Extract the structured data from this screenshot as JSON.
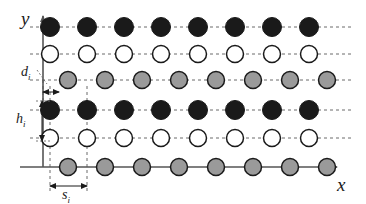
{
  "figure": {
    "axes": {
      "x_label": "x",
      "y_label": "y",
      "axis_color": "#555555",
      "origin": {
        "x": 43,
        "y": 167
      }
    },
    "colors": {
      "filled_black": "#1a1a1a",
      "filled_white": "#ffffff",
      "filled_gray": "#9a9a9a",
      "outline": "#1a1a1a",
      "dashed_guide": "#6b6b6b",
      "axis": "#555555"
    },
    "geometry": {
      "columns": 8,
      "rows": 6,
      "column_spacing_px": 37,
      "row_base_x_px": 50,
      "offset_row_shift_px": 18,
      "circle_radius_black_px": 9.5,
      "circle_radius_white_px": 8.5,
      "circle_radius_gray_px": 8.5
    },
    "rows": [
      {
        "index": 0,
        "fill": "filled_black",
        "label": "black-row-top",
        "y": 27,
        "x_start": 50,
        "offset": false,
        "count": 8,
        "guide": "dashed"
      },
      {
        "index": 1,
        "fill": "filled_white",
        "label": "white-row-upper",
        "y": 54,
        "x_start": 50,
        "offset": false,
        "count": 8,
        "guide": "dashed"
      },
      {
        "index": 2,
        "fill": "filled_gray",
        "label": "gray-row-upper",
        "y": 80,
        "x_start": 68,
        "offset": true,
        "count": 8,
        "guide": "dashed"
      },
      {
        "index": 3,
        "fill": "filled_black",
        "label": "black-row-lower",
        "y": 110,
        "x_start": 50,
        "offset": false,
        "count": 8,
        "guide": "dashed"
      },
      {
        "index": 4,
        "fill": "filled_white",
        "label": "white-row-lower",
        "y": 138,
        "x_start": 50,
        "offset": false,
        "count": 8,
        "guide": "dashed"
      },
      {
        "index": 5,
        "fill": "filled_gray",
        "label": "gray-row-baseline",
        "y": 167,
        "x_start": 68,
        "offset": true,
        "count": 8,
        "guide": "solid"
      }
    ],
    "dimension_labels": [
      {
        "name": "d-offset-label",
        "symbol": "d",
        "subscript": "i",
        "meaning": "horizontal offset of staggered row",
        "x": 21,
        "y": 76
      },
      {
        "name": "h-height-label",
        "symbol": "h",
        "subscript": "i",
        "meaning": "vertical layer spacing",
        "x": 16,
        "y": 123
      },
      {
        "name": "s-spacing-label",
        "symbol": "s",
        "subscript": "i",
        "meaning": "horizontal in-row spacing",
        "x": 79,
        "y": 196
      }
    ],
    "dimension_arrows": [
      {
        "name": "d-offset-arrow",
        "type": "horizontal",
        "x1": 43,
        "x2": 59,
        "y": 92,
        "leader_from_x": 37,
        "leader_from_y": 70
      },
      {
        "name": "h-height-arrow",
        "type": "vertical",
        "y1": 101,
        "y2": 140,
        "x": 42
      },
      {
        "name": "s-spacing-arrow",
        "type": "horizontal",
        "x1": 50,
        "x2": 87,
        "y": 186
      }
    ]
  }
}
